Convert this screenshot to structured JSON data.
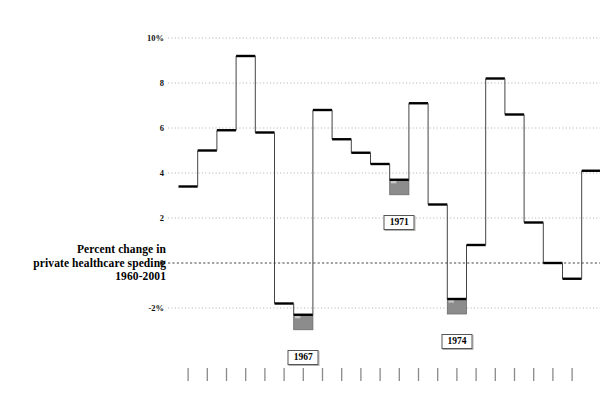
{
  "caption": {
    "line1": "Percent change in",
    "line2": "private healthcare speding",
    "line3": "1960-2001"
  },
  "axis": {
    "y_tick_labels": [
      "10%",
      "8",
      "6",
      "4",
      "2",
      "0",
      "-2%"
    ],
    "y_tick_values": [
      10,
      8,
      6,
      4,
      2,
      0,
      -2
    ],
    "x_tick_count": 21
  },
  "colors": {
    "line": "#000000",
    "riser": "#444444",
    "gridline": "#9a9a9a",
    "zero_line": "#333333",
    "highlight_fill": "#8c8c8c",
    "highlight_edge": "#6b6b6b",
    "tick": "#8a8a8a",
    "text": "#000000",
    "box_border": "#555555",
    "background": "#ffffff"
  },
  "annotations": [
    {
      "label": "1967",
      "index": 6,
      "value": -2.3
    },
    {
      "label": "1971",
      "index": 11,
      "value": 3.7
    },
    {
      "label": "1974",
      "index": 14,
      "value": -1.6
    }
  ],
  "chart_data": {
    "type": "line",
    "title": "Percent change in private healthcare speding 1960-2001",
    "subtitle": "",
    "xlabel": "",
    "ylabel": "Percent change",
    "ylim": [
      -3.0,
      10.6
    ],
    "yticks": [
      -2,
      0,
      2,
      4,
      6,
      8,
      10
    ],
    "ytick_labels": [
      "-2%",
      "0",
      "2",
      "4",
      "6",
      "8",
      "10%"
    ],
    "grid": true,
    "legend": "none",
    "step": "post",
    "categories": [
      "1960",
      "1961",
      "1962",
      "1963",
      "1964",
      "1965",
      "1966",
      "1967",
      "1968",
      "1969",
      "1970",
      "1971",
      "1972",
      "1973",
      "1974",
      "1975",
      "1976",
      "1977",
      "1978",
      "1979",
      "1980",
      "1981"
    ],
    "series": [
      {
        "name": "Percent change in private healthcare spending",
        "values": [
          3.4,
          5.0,
          5.9,
          9.2,
          5.8,
          -1.8,
          -2.3,
          6.8,
          5.5,
          4.9,
          4.4,
          3.7,
          7.1,
          2.6,
          -1.6,
          0.8,
          8.2,
          6.6,
          1.8,
          0.0,
          -0.7,
          4.1
        ]
      }
    ],
    "highlighted_points": [
      {
        "category": "1967",
        "value": -2.3
      },
      {
        "category": "1971",
        "value": 3.7
      },
      {
        "category": "1974",
        "value": -1.6
      }
    ]
  }
}
